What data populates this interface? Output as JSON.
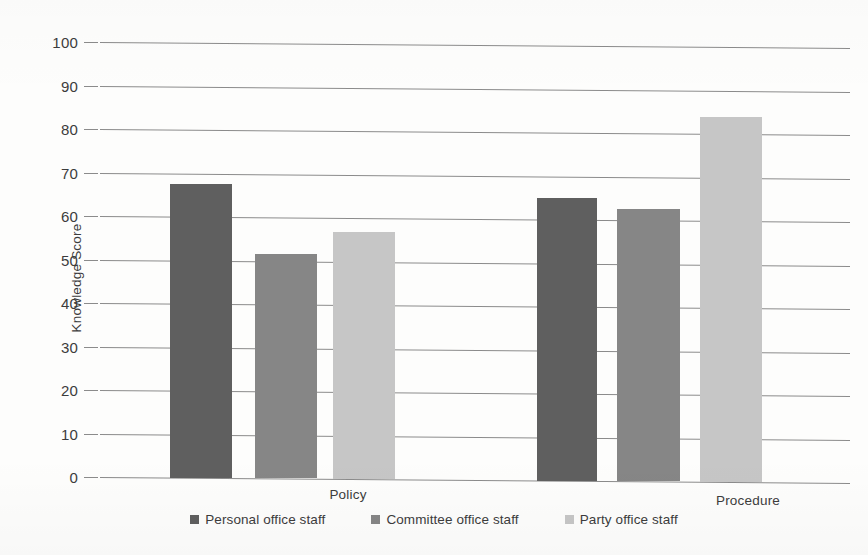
{
  "chart_data": {
    "type": "bar",
    "title": "",
    "subtitle": "",
    "xlabel": "",
    "ylabel": "Knowledge Score",
    "categories": [
      "Policy",
      "Procedure"
    ],
    "series": [
      {
        "name": "Personal office staff",
        "color": "#5f5f5f",
        "values": [
          67.5,
          65.0
        ]
      },
      {
        "name": "Committee office staff",
        "color": "#868686",
        "values": [
          51.5,
          62.5
        ]
      },
      {
        "name": "Party office staff",
        "color": "#c6c6c6",
        "values": [
          56.8,
          84.0
        ]
      }
    ],
    "ylim": [
      0,
      100
    ],
    "ytick_step": 10,
    "yticks": [
      "100",
      "90",
      "80",
      "70",
      "60",
      "50",
      "40",
      "30",
      "20",
      "10",
      "0"
    ],
    "grid": true,
    "grid_color": "#8b8b8b",
    "legend_position": "bottom",
    "background": "#fdfdfc"
  },
  "axis": {
    "y_title": "Knowledge Score"
  },
  "legend": {
    "items": [
      {
        "label": "Personal office staff",
        "swatch": "#5f5f5f"
      },
      {
        "label": "Committee office staff",
        "swatch": "#868686"
      },
      {
        "label": "Party office staff",
        "swatch": "#c6c6c6"
      }
    ]
  }
}
